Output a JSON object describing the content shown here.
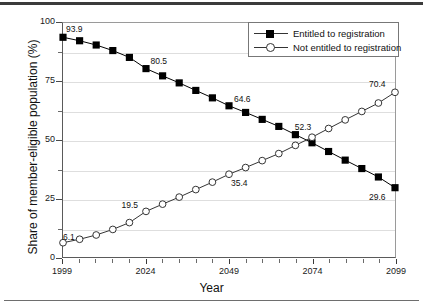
{
  "figure": {
    "background": "#ffffff",
    "axis_color": "#4a4a4a",
    "grid_color": "#dedede"
  },
  "chart_data": {
    "type": "line",
    "title": "",
    "xlabel": "Year",
    "ylabel": "Share of member-eligible population (%)",
    "xlim": [
      1999,
      2099
    ],
    "ylim": [
      0,
      100
    ],
    "grid": true,
    "grid_values": [
      12.5,
      25,
      37.5,
      50,
      62.5,
      75,
      87.5
    ],
    "y_ticks_major": [
      0,
      25,
      50,
      75,
      100
    ],
    "y_ticks_minor": [
      12.5,
      37.5,
      62.5,
      87.5
    ],
    "y_tick_labels": [
      "0",
      "25",
      "50",
      "75",
      "100"
    ],
    "x_ticks_major": [
      1999,
      2024,
      2049,
      2074,
      2099
    ],
    "x_tick_labels": [
      "1999",
      "2024",
      "2049",
      "2074",
      "2099"
    ],
    "x_ticks_minor": [
      2004,
      2009,
      2014,
      2019,
      2029,
      2034,
      2039,
      2044,
      2054,
      2059,
      2064,
      2069,
      2079,
      2084,
      2089,
      2094
    ],
    "x": [
      1999,
      2004,
      2009,
      2014,
      2019,
      2024,
      2029,
      2034,
      2039,
      2044,
      2049,
      2054,
      2059,
      2064,
      2069,
      2074,
      2079,
      2084,
      2089,
      2094,
      2099
    ],
    "legend_position": "top-right",
    "series": [
      {
        "name": "Entitled to registration",
        "marker": "filled-square",
        "color": "#000000",
        "values": [
          93.9,
          92.4,
          90.6,
          88.2,
          85.3,
          80.5,
          77.4,
          74.4,
          71.2,
          68.0,
          64.6,
          61.8,
          58.8,
          55.8,
          52.3,
          48.8,
          45.1,
          41.4,
          37.8,
          34.2,
          29.6
        ]
      },
      {
        "name": "Not entitled to registration",
        "marker": "hollow-circle",
        "color": "#333333",
        "values": [
          6.1,
          7.6,
          9.4,
          11.8,
          14.7,
          19.5,
          22.6,
          25.6,
          28.8,
          32.0,
          35.4,
          38.2,
          41.2,
          44.2,
          47.7,
          51.2,
          54.9,
          58.6,
          62.2,
          65.8,
          70.4
        ]
      }
    ],
    "annotations": [
      {
        "text": "93.9",
        "x": 1999,
        "y": 93.9,
        "dx": 4,
        "dy": -11,
        "series": 0
      },
      {
        "text": "80.5",
        "x": 2024,
        "y": 80.5,
        "dx": 5,
        "dy": -11,
        "series": 0
      },
      {
        "text": "64.6",
        "x": 2049,
        "y": 64.6,
        "dx": 5,
        "dy": -11,
        "series": 0
      },
      {
        "text": "52.3",
        "x": 2069,
        "y": 52.3,
        "dx": -1,
        "dy": -12,
        "series": 0
      },
      {
        "text": "29.6",
        "x": 2099,
        "y": 29.6,
        "dx": -27,
        "dy": 5,
        "series": 0
      },
      {
        "text": "6.1",
        "x": 1999,
        "y": 6.1,
        "dx": 1,
        "dy": -11,
        "series": 1
      },
      {
        "text": "19.5",
        "x": 2024,
        "y": 19.5,
        "dx": -24,
        "dy": -11,
        "series": 1
      },
      {
        "text": "35.4",
        "x": 2049,
        "y": 35.4,
        "dx": 2,
        "dy": 4,
        "series": 1
      },
      {
        "text": "70.4",
        "x": 2099,
        "y": 70.4,
        "dx": -27,
        "dy": -12,
        "series": 1
      }
    ]
  },
  "legend": {
    "entries": [
      {
        "label": "Entitled to registration",
        "marker": "filled-square"
      },
      {
        "label": "Not entitled to registration",
        "marker": "hollow-circle"
      }
    ]
  }
}
